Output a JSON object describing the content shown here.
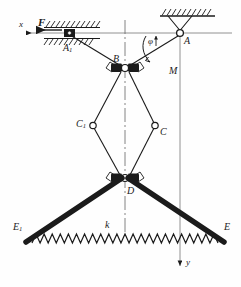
{
  "figure": {
    "type": "mechanical-linkage-diagram",
    "ink_color": "#1b1b1b",
    "background": "#fefefe"
  },
  "axes": {
    "x_label": "x",
    "y_label": "y",
    "x_axis_y": 33,
    "y_axis_x": 180
  },
  "loads": {
    "force_label": "F",
    "moment_label": "M",
    "angle_label": "φ"
  },
  "joints": [
    {
      "id": "A1",
      "label": "A",
      "sub": "1",
      "x": 70,
      "y": 33,
      "kind": "slider-in-guide"
    },
    {
      "id": "A",
      "label": "A",
      "sub": "",
      "x": 180,
      "y": 33,
      "kind": "pin-support"
    },
    {
      "id": "B",
      "label": "B",
      "sub": "",
      "x": 125,
      "y": 68,
      "kind": "sliding-collar"
    },
    {
      "id": "C1",
      "label": "C",
      "sub": "1",
      "x": 93,
      "y": 125,
      "kind": "pin"
    },
    {
      "id": "C",
      "label": "C",
      "sub": "",
      "x": 155,
      "y": 125,
      "kind": "pin"
    },
    {
      "id": "D",
      "label": "D",
      "sub": "",
      "x": 125,
      "y": 178,
      "kind": "sliding-collar"
    },
    {
      "id": "E1",
      "label": "E",
      "sub": "1",
      "x": 30,
      "y": 239,
      "kind": "arm-end"
    },
    {
      "id": "E",
      "label": "E",
      "sub": "",
      "x": 220,
      "y": 239,
      "kind": "arm-end"
    }
  ],
  "spring": {
    "label": "k",
    "coils": 23,
    "x_start": 32,
    "x_end": 218,
    "y": 243,
    "amplitude": 9
  },
  "labels": {
    "x": "x",
    "y": "y",
    "F": "F",
    "M": "M",
    "phi": "φ",
    "k": "k",
    "A1_main": "A",
    "A1_sub": "1",
    "A_main": "A",
    "B_main": "B",
    "C1_main": "C",
    "C1_sub": "1",
    "C_main": "C",
    "D_main": "D",
    "E1_main": "E",
    "E1_sub": "1",
    "E_main": "E"
  }
}
